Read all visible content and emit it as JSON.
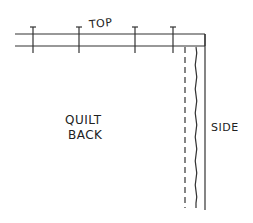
{
  "diagram": {
    "labels": {
      "top": "TOP",
      "side": "SIDE",
      "center_line1": "QUILT",
      "center_line2": "BACK"
    },
    "pins_x": [
      33,
      79,
      135,
      173
    ],
    "stroke_color": "#333333"
  }
}
